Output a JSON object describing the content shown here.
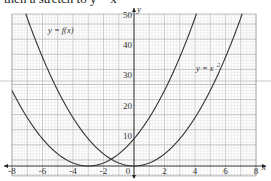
{
  "header": {
    "text": "then a stretch to y = x"
  },
  "chart_data": {
    "type": "line",
    "title": "",
    "xlabel": "x",
    "ylabel": "y",
    "xlim": [
      -8,
      8
    ],
    "ylim": [
      0,
      50
    ],
    "grid": true,
    "x_ticks": [
      "-8",
      "-6",
      "-4",
      "-2",
      "0",
      "2",
      "4",
      "6",
      "8"
    ],
    "y_ticks": [
      "10",
      "20",
      "30",
      "40",
      "50"
    ],
    "series": [
      {
        "name": "y = f(x)",
        "label": "y = f(x)",
        "vertex": [
          -3,
          0
        ],
        "formula": "(x+3)^2"
      },
      {
        "name": "y = x²",
        "label": "y = x²",
        "vertex": [
          0,
          0
        ],
        "formula": "x^2"
      }
    ]
  },
  "labels": {
    "fx": "y = f(x)",
    "x2": "y = x",
    "x2sup": "2",
    "xaxis": "x",
    "yaxis": "y"
  }
}
